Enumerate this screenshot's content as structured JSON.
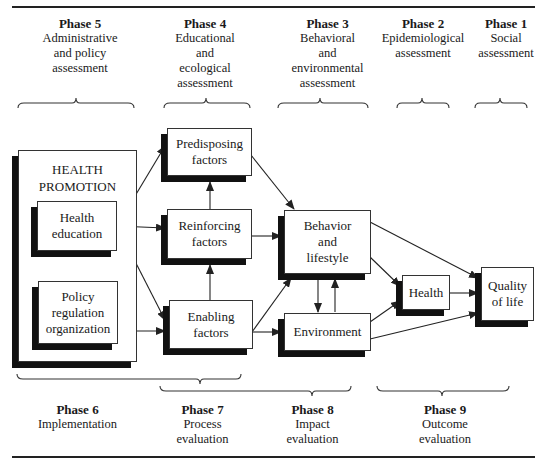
{
  "top_phases": [
    {
      "phase": "Phase 5",
      "desc": "Administrative\nand policy\nassessment"
    },
    {
      "phase": "Phase 4",
      "desc": "Educational\nand\necological\nassessment"
    },
    {
      "phase": "Phase 3",
      "desc": "Behavioral\nand\nenvironmental\nassessment"
    },
    {
      "phase": "Phase 2",
      "desc": "Epidemiological\nassessment"
    },
    {
      "phase": "Phase 1",
      "desc": "Social\nassessment"
    }
  ],
  "bottom_phases": [
    {
      "phase": "Phase 6",
      "desc": "Implementation"
    },
    {
      "phase": "Phase 7",
      "desc": "Process\nevaluation"
    },
    {
      "phase": "Phase 8",
      "desc": "Impact\nevaluation"
    },
    {
      "phase": "Phase 9",
      "desc": "Outcome\nevaluation"
    }
  ],
  "health_promotion": {
    "title": "HEALTH\nPROMOTION",
    "health_education": "Health\neducation",
    "policy": "Policy\nregulation\norganization"
  },
  "factors": {
    "predisposing": "Predisposing\nfactors",
    "reinforcing": "Reinforcing\nfactors",
    "enabling": "Enabling\nfactors"
  },
  "behavior": "Behavior\nand\nlifestyle",
  "environment": "Environment",
  "health": "Health",
  "quality_of_life": "Quality\nof life"
}
